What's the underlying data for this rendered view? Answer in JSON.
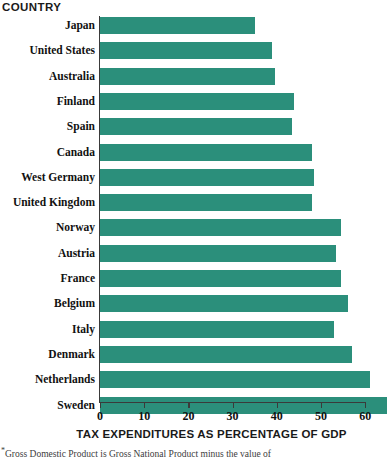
{
  "chart_data": {
    "type": "bar",
    "orientation": "horizontal",
    "title": "",
    "xlabel": "TAX EXPENDITURES AS PERCENTAGE OF GDP",
    "ylabel": "COUNTRY",
    "xlim": [
      0,
      60
    ],
    "xticks": [
      0,
      10,
      20,
      30,
      40,
      50,
      60
    ],
    "xtick_labels": [
      "0",
      "10",
      "20",
      "30",
      "40",
      "50",
      "60"
    ],
    "grid": false,
    "legend": false,
    "bar_color": "#2b8f7b",
    "categories": [
      "Japan",
      "United States",
      "Australia",
      "Finland",
      "Spain",
      "Canada",
      "West Germany",
      "United Kingdom",
      "Norway",
      "Austria",
      "France",
      "Belgium",
      "Italy",
      "Denmark",
      "Netherlands",
      "Sweden"
    ],
    "values": [
      35,
      39,
      39.5,
      44,
      43.5,
      48,
      48.5,
      48,
      54.5,
      53.5,
      54.5,
      56,
      53,
      57,
      61,
      65
    ],
    "bars": [
      {
        "label": "Japan",
        "value": 35
      },
      {
        "label": "United States",
        "value": 39
      },
      {
        "label": "Australia",
        "value": 39.5
      },
      {
        "label": "Finland",
        "value": 44
      },
      {
        "label": "Spain",
        "value": 43.5
      },
      {
        "label": "Canada",
        "value": 48
      },
      {
        "label": "West Germany",
        "value": 48.5
      },
      {
        "label": "United Kingdom",
        "value": 48
      },
      {
        "label": "Norway",
        "value": 54.5
      },
      {
        "label": "Austria",
        "value": 53.5
      },
      {
        "label": "France",
        "value": 54.5
      },
      {
        "label": "Belgium",
        "value": 56
      },
      {
        "label": "Italy",
        "value": 53
      },
      {
        "label": "Denmark",
        "value": 57
      },
      {
        "label": "Netherlands",
        "value": 61
      },
      {
        "label": "Sweden",
        "value": 65
      }
    ]
  },
  "footnote": {
    "marker": "*",
    "text": "Gross Domestic Product is Gross National Product minus the value of"
  }
}
